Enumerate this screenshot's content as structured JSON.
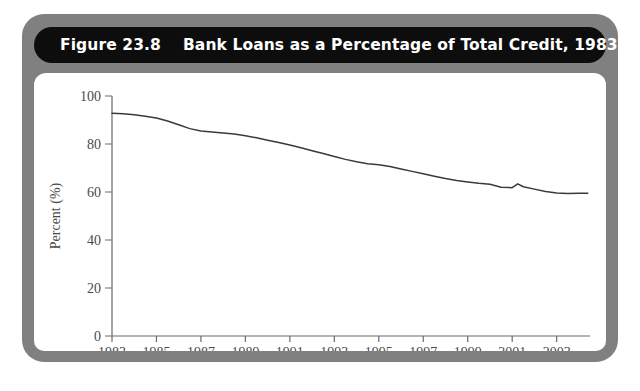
{
  "figure": {
    "number_label": "Figure 23.8",
    "title": "Bank Loans as a Percentage of Total Credit, 1983–2004",
    "title_full": "Figure 23.8    Bank Loans as a Percentage of Total Credit, 1983–2004",
    "frame_color": "#808080",
    "title_bar_color": "#0d0d0d",
    "title_text_color": "#ffffff",
    "plot_background": "#ffffff",
    "line_color": "#3a3a3a",
    "axis_color": "#6b6b6b",
    "caption_partial": ""
  },
  "chart_data": {
    "type": "line",
    "title": "Bank Loans as a Percentage of Total Credit, 1983–2004",
    "xlabel": "",
    "ylabel": "Percent (%)",
    "xlim": [
      1983,
      2004.5
    ],
    "ylim": [
      0,
      100
    ],
    "grid": false,
    "legend": "none",
    "ytick_labels": [
      "0",
      "20",
      "40",
      "60",
      "80",
      "100"
    ],
    "ytick_values": [
      0,
      20,
      40,
      60,
      80,
      100
    ],
    "xtick_labels": [
      "1983",
      "1985",
      "1987",
      "1989",
      "1991",
      "1993",
      "1995",
      "1997",
      "1999",
      "2001",
      "2003"
    ],
    "xtick_values": [
      1983,
      1985,
      1987,
      1989,
      1991,
      1993,
      1995,
      1997,
      1999,
      2001,
      2003
    ],
    "series": [
      {
        "name": "Bank loans as a percentage of total credit",
        "x": [
          1983,
          1983.5,
          1984,
          1984.5,
          1985,
          1985.5,
          1986,
          1986.5,
          1987,
          1987.5,
          1988,
          1988.5,
          1989,
          1989.5,
          1990,
          1990.5,
          1991,
          1991.5,
          1992,
          1992.5,
          1993,
          1993.5,
          1994,
          1994.5,
          1995,
          1995.5,
          1996,
          1996.5,
          1997,
          1997.5,
          1998,
          1998.5,
          1999,
          1999.5,
          2000,
          2000.5,
          2001,
          2001.25,
          2001.5,
          2002,
          2002.5,
          2003,
          2003.5,
          2004,
          2004.4
        ],
        "values": [
          92.8,
          92.6,
          92.2,
          91.6,
          90.8,
          89.6,
          88.0,
          86.4,
          85.4,
          85.0,
          84.6,
          84.2,
          83.4,
          82.6,
          81.6,
          80.6,
          79.6,
          78.4,
          77.2,
          76.0,
          74.8,
          73.6,
          72.6,
          71.8,
          71.4,
          70.6,
          69.6,
          68.6,
          67.6,
          66.6,
          65.6,
          64.8,
          64.2,
          63.6,
          63.2,
          62.0,
          61.8,
          63.4,
          62.2,
          61.2,
          60.2,
          59.6,
          59.4,
          59.5,
          59.5
        ]
      }
    ],
    "annotations": []
  }
}
